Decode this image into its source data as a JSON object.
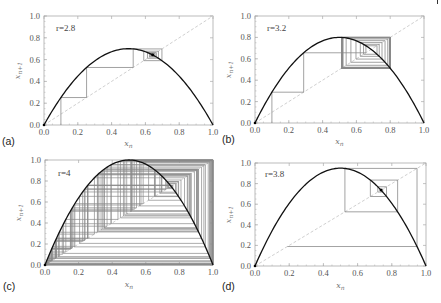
{
  "chart_data": [
    {
      "type": "line",
      "panel_label": "(a)",
      "title": "r = 2.8",
      "r_text": "r=2.8",
      "r": 2.8,
      "x0": 0.1,
      "iterations": 40,
      "xlabel": "x_n",
      "ylabel": "x_{n+1}",
      "xlim": [
        0,
        1
      ],
      "ylim": [
        0,
        1
      ],
      "xticks": [
        "0.0",
        "0.2",
        "0.4",
        "0.6",
        "0.8",
        "1.0"
      ],
      "yticks": [
        "0.0",
        "0.2",
        "0.4",
        "0.6",
        "0.8",
        "1.0"
      ],
      "series": [
        {
          "name": "logistic map f(x)=r x (1-x)",
          "style": "solid black"
        },
        {
          "name": "diagonal y=x",
          "style": "dashed light gray"
        },
        {
          "name": "cobweb iteration",
          "style": "thin gray"
        }
      ],
      "fixed_point": 0.643,
      "peak": 0.7,
      "grid": false
    },
    {
      "type": "line",
      "panel_label": "(b)",
      "title": "r = 3.2",
      "r_text": "r=3.2",
      "r": 3.2,
      "x0": 0.1,
      "iterations": 40,
      "xlabel": "x_n",
      "ylabel": "x_{n+1}",
      "xlim": [
        0,
        1
      ],
      "ylim": [
        0,
        1
      ],
      "xticks": [
        "0.0",
        "0.2",
        "0.4",
        "0.6",
        "0.8",
        "1.0"
      ],
      "yticks": [
        "0.0",
        "0.2",
        "0.4",
        "0.6",
        "0.8",
        "1.0"
      ],
      "series": [
        {
          "name": "logistic map f(x)=r x (1-x)",
          "style": "solid black"
        },
        {
          "name": "diagonal y=x",
          "style": "dashed light gray"
        },
        {
          "name": "cobweb iteration",
          "style": "thin gray"
        }
      ],
      "period2_orbit": [
        0.513,
        0.799
      ],
      "peak": 0.8,
      "grid": false
    },
    {
      "type": "line",
      "panel_label": "(c)",
      "title": "r = 4",
      "r_text": "r=4",
      "r": 4.0,
      "x0": 0.01,
      "iterations": 120,
      "xlabel": "x_n",
      "ylabel": "x_{n+1}",
      "xlim": [
        0,
        1
      ],
      "ylim": [
        0,
        1
      ],
      "xticks": [
        "0.0",
        "0.2",
        "0.4",
        "0.6",
        "0.8",
        "1.0"
      ],
      "yticks": [
        "0.0",
        "0.2",
        "0.4",
        "0.6",
        "0.8",
        "1.0"
      ],
      "series": [
        {
          "name": "logistic map f(x)=r x (1-x)",
          "style": "solid black"
        },
        {
          "name": "diagonal y=x",
          "style": "dashed light gray"
        },
        {
          "name": "cobweb iteration (chaotic)",
          "style": "thin gray"
        }
      ],
      "peak": 1.0,
      "grid": false
    },
    {
      "type": "line",
      "panel_label": "(d)",
      "title": "r = 3.8",
      "r_text": "r=3.8",
      "r": 3.8,
      "x0": 0.74,
      "iterations": 9,
      "xlabel": "x_n",
      "ylabel": "x_{n+1}",
      "xlim": [
        0,
        1
      ],
      "ylim": [
        0,
        1
      ],
      "xticks": [
        "0.0",
        "0.2",
        "0.4",
        "0.6",
        "0.8",
        "1.0"
      ],
      "yticks": [
        "0.0",
        "0.2",
        "0.4",
        "0.6",
        "0.8",
        "1.0"
      ],
      "series": [
        {
          "name": "logistic map f(x)=r x (1-x)",
          "style": "solid black"
        },
        {
          "name": "diagonal y=x",
          "style": "dashed light gray"
        },
        {
          "name": "cobweb iteration",
          "style": "thin gray"
        }
      ],
      "fixed_point": 0.737,
      "peak": 0.95,
      "grid": false
    }
  ],
  "layout": {
    "panels": [
      {
        "x": 44,
        "y": 16,
        "w": 169,
        "h": 109,
        "label_x": 2,
        "label_y": 145,
        "xlabel_y": 146,
        "r_x": 56,
        "r_y": 31
      },
      {
        "x": 255,
        "y": 16,
        "w": 169,
        "h": 107,
        "label_x": 222,
        "label_y": 143,
        "xlabel_y": 144,
        "r_x": 267,
        "r_y": 31
      },
      {
        "x": 45,
        "y": 160,
        "w": 168,
        "h": 105,
        "label_x": 3,
        "label_y": 290,
        "xlabel_y": 287,
        "r_x": 58,
        "r_y": 176
      },
      {
        "x": 255,
        "y": 163,
        "w": 171,
        "h": 103,
        "label_x": 222,
        "label_y": 290,
        "xlabel_y": 288,
        "r_x": 265,
        "r_y": 177
      }
    ]
  },
  "colors": {
    "curve": "#111111",
    "frame": "#aaaaaa",
    "cobweb": "#8a8a8a",
    "diagonal": "#d0d0d0",
    "text": "#555555"
  }
}
